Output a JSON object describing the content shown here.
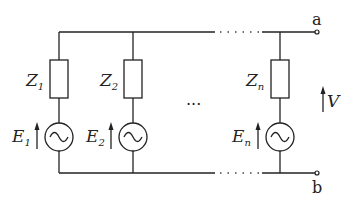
{
  "diagram": {
    "type": "circuit",
    "branches": [
      {
        "impedance": {
          "main": "Z",
          "sub": "1"
        },
        "source": {
          "main": "E",
          "sub": "1"
        }
      },
      {
        "impedance": {
          "main": "Z",
          "sub": "2"
        },
        "source": {
          "main": "E",
          "sub": "2"
        }
      },
      {
        "impedance": {
          "main": "Z",
          "sub": "n"
        },
        "source": {
          "main": "E",
          "sub": "n"
        }
      }
    ],
    "ellipsis": "···",
    "terminals": {
      "top": "a",
      "bottom": "b"
    },
    "voltage": {
      "label": "V"
    },
    "source_symbol": "~",
    "colors": {
      "line": "#222222",
      "background": "#ffffff"
    }
  }
}
